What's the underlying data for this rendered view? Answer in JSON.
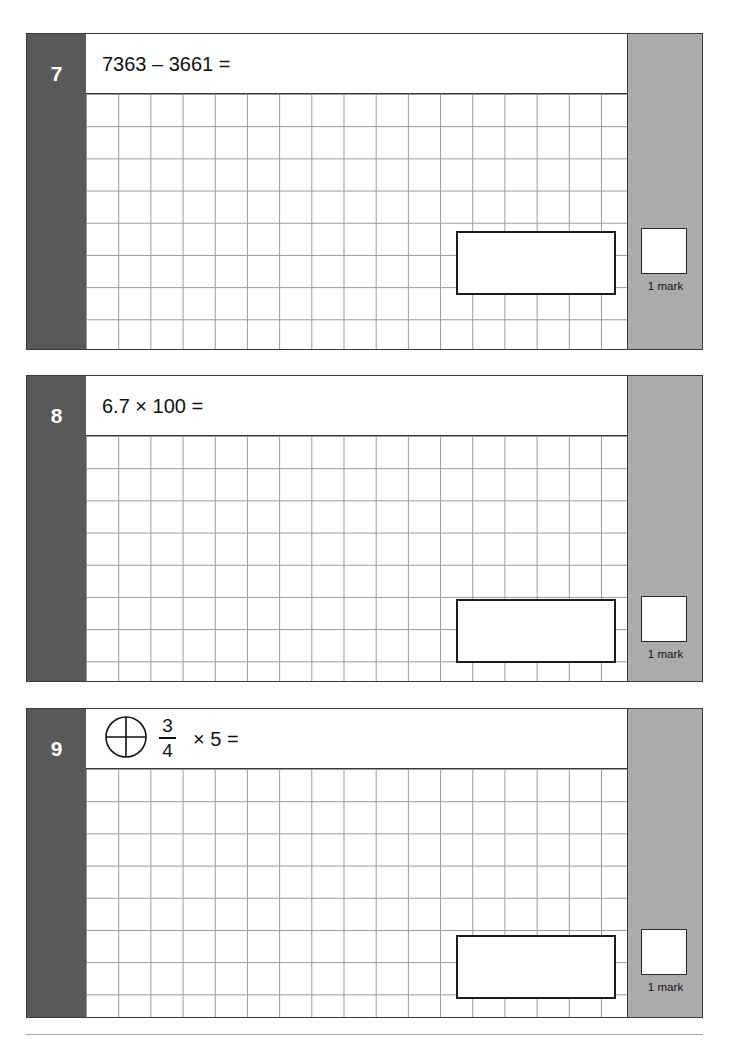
{
  "page": {
    "background_color": "#ffffff",
    "number_column_color": "#595959",
    "mark_column_color": "#ababab",
    "grid_line_color": "#9a9a9a",
    "border_color": "#3a3a3a"
  },
  "questions": [
    {
      "number": "7",
      "text": "7363 – 3661 =",
      "has_fraction_icon": false,
      "mark_label": "1 mark"
    },
    {
      "number": "8",
      "text": "6.7 × 100 =",
      "has_fraction_icon": false,
      "mark_label": "1 mark"
    },
    {
      "number": "9",
      "text": "",
      "has_fraction_icon": true,
      "fraction": {
        "numerator": "3",
        "denominator": "4"
      },
      "fraction_tail": "× 5 =",
      "mark_label": "1 mark"
    }
  ]
}
